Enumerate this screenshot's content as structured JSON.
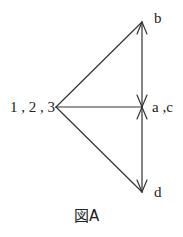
{
  "diagram": {
    "caption": "図A",
    "line_color": "#333333",
    "nodes": {
      "left": {
        "label": "1 , 2 , 3",
        "x": 56,
        "y": 107
      },
      "top": {
        "label": "b",
        "x": 142,
        "y": 22
      },
      "middle": {
        "label": "a ,c",
        "x": 142,
        "y": 107
      },
      "bottom": {
        "label": "d",
        "x": 142,
        "y": 192
      }
    },
    "edges": [
      {
        "from": "1,2,3",
        "to": "b",
        "arrow": "at b"
      },
      {
        "from": "1,2,3",
        "to": "a,c",
        "arrow": "none"
      },
      {
        "from": "1,2,3",
        "to": "d",
        "arrow": "at d"
      },
      {
        "from": "a,c",
        "to": "b",
        "arrow": "both ends"
      },
      {
        "from": "a,c",
        "to": "d",
        "arrow": "both ends"
      }
    ]
  }
}
